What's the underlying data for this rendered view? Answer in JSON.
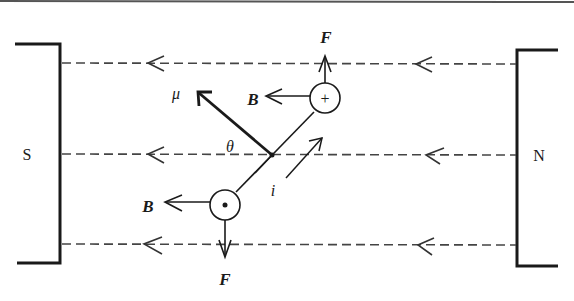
{
  "diagram": {
    "title": "",
    "magnets": {
      "left": {
        "label": "S"
      },
      "right": {
        "label": "N"
      }
    },
    "labels": {
      "force_top": "F",
      "force_bottom": "F",
      "field_top": "B",
      "field_bottom": "B",
      "magnetic_moment": "μ",
      "angle": "θ",
      "current": "i",
      "plus_symbol": "+",
      "dot_symbol": "•"
    },
    "field_lines": [
      {
        "y": 63,
        "direction": "left"
      },
      {
        "y": 154,
        "direction": "left"
      },
      {
        "y": 244,
        "direction": "left"
      }
    ],
    "colors": {
      "ink": "#1a1a1a",
      "dashed": "#444444",
      "background": "#ffffff"
    }
  }
}
